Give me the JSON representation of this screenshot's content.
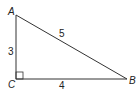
{
  "diagram": {
    "type": "right-triangle",
    "vertices": {
      "A": {
        "label": "A"
      },
      "B": {
        "label": "B"
      },
      "C": {
        "label": "C"
      }
    },
    "sides": {
      "AC": {
        "label": "3"
      },
      "AB": {
        "label": "5"
      },
      "CB": {
        "label": "4"
      }
    },
    "right_angle_at": "C",
    "colors": {
      "stroke": "#333333",
      "text": "#222222"
    }
  }
}
